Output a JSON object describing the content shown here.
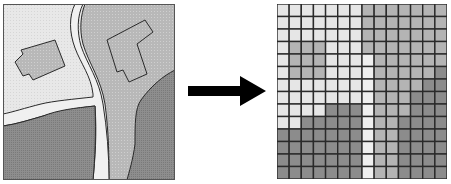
{
  "figure": {
    "colors": {
      "light": "#e6e6e6",
      "road": "#efefef",
      "medium": "#b4b4b4",
      "dark": "#8c8c8c",
      "outline": "#2a2a2a",
      "arrow": "#000000",
      "background": "#ffffff"
    }
  },
  "vector_map": {
    "label": "vector-map",
    "regions": [
      {
        "name": "light-area",
        "shade": "light"
      },
      {
        "name": "road",
        "shade": "road"
      },
      {
        "name": "lawn-area",
        "shade": "medium"
      },
      {
        "name": "building-left",
        "shade": "medium"
      },
      {
        "name": "building-right",
        "shade": "medium"
      },
      {
        "name": "field-bottom-left",
        "shade": "dark"
      },
      {
        "name": "field-right",
        "shade": "dark"
      }
    ]
  },
  "arrow": {
    "icon": "right-arrow-icon",
    "direction": "right"
  },
  "raster_grid": {
    "rows": 14,
    "cols": 14,
    "legend": {
      "L": "light",
      "R": "road",
      "M": "medium",
      "D": "dark"
    },
    "cells": [
      "LLLLLLLMMMMMMM",
      "LLLLLLLMMMMMMM",
      "LLLLLLLMMMMMMM",
      "LMMMLLLMMMMMMM",
      "LMMMLLLRMMMMMM",
      "LMMMLLLRMMMMMD",
      "LLLLLLLRMMMMDD",
      "LLLLLLLRMMMDDD",
      "LLLLDDDRMMMDDD",
      "LLDDDDDRMMDDDD",
      "DDDDDDDRMMDDDD",
      "DDDDDDDRMMDDDD",
      "DDDDDDDRMMDDDD",
      "DDDDDDDRMMDDDD"
    ]
  }
}
